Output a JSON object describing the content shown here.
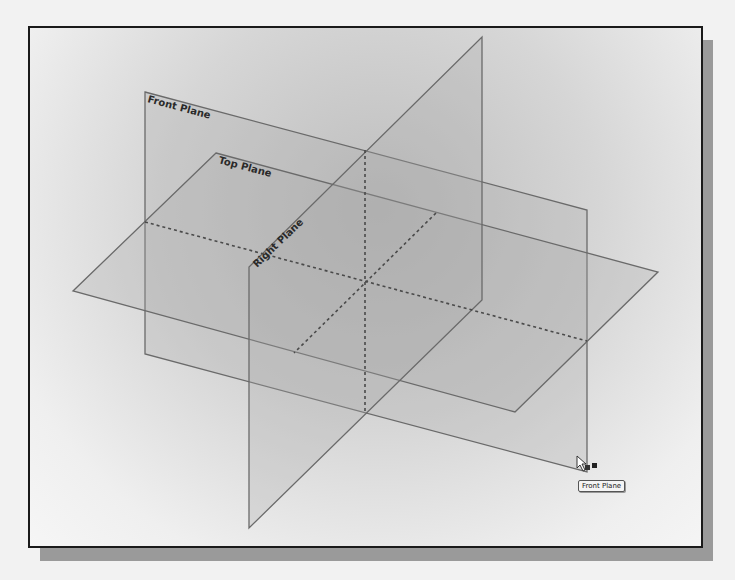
{
  "viewport": {
    "title": "Default reference planes view"
  },
  "planes": [
    {
      "id": "front",
      "label": "Front Plane"
    },
    {
      "id": "top",
      "label": "Top Plane"
    },
    {
      "id": "right",
      "label": "Right Plane"
    }
  ],
  "cursor": {
    "icon": "pointer-arrow-icon",
    "hover_target": "Front Plane"
  },
  "tooltip": {
    "text": "Front Plane"
  },
  "colors": {
    "plane_fill": "#a8a8a8",
    "plane_edge": "#6a6a6a",
    "frame_border": "#1a1a1a",
    "shadow": "#9a9a9a"
  }
}
